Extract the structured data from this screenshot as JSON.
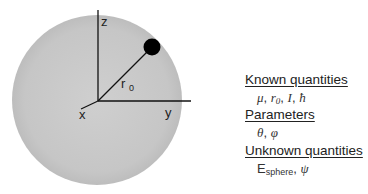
{
  "diagram": {
    "sphere": {
      "cx": 97,
      "cy": 100,
      "r": 85,
      "fill": "#c9c9c9"
    },
    "particle": {
      "cx": 152,
      "cy": 47,
      "r": 8,
      "fill": "#000000"
    },
    "origin": {
      "x": 98,
      "y": 101
    },
    "axes": {
      "z": {
        "label": "z",
        "end": {
          "x": 98,
          "y": 10
        }
      },
      "y": {
        "label": "y",
        "end": {
          "x": 191,
          "y": 101
        }
      },
      "x": {
        "label": "x",
        "end": {
          "x": 81,
          "y": 109
        }
      }
    },
    "radius_label": {
      "symbol": "r",
      "subscript": "0"
    }
  },
  "legend": {
    "known": {
      "heading": "Known quantities",
      "mu": "μ",
      "r": "r",
      "r_sub": "0",
      "I": "I",
      "hbar": "ħ",
      "sep": ", "
    },
    "parameters": {
      "heading": "Parameters",
      "theta": "θ",
      "phi": "φ",
      "sep": ", "
    },
    "unknown": {
      "heading": "Unknown quantities",
      "E": "E",
      "E_sub": "sphere",
      "psi": "ψ",
      "sep": ", "
    }
  }
}
